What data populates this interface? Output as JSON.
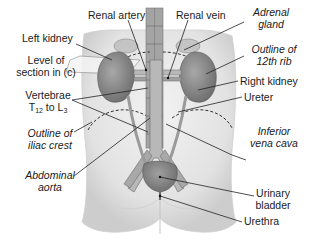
{
  "diagram": {
    "labels": {
      "renal_artery": "Renal artery",
      "renal_vein": "Renal vein",
      "adrenal_gland_1": "Adrenal",
      "adrenal_gland_2": "gland",
      "left_kidney": "Left kidney",
      "level_1": "Level of",
      "level_2": "section in (c)",
      "outline_12th_rib_1": "Outline of",
      "outline_12th_rib_2": "12th rib",
      "right_kidney": "Right kidney",
      "vertebrae_1": "Vertebrae",
      "vertebrae_t": "T",
      "vertebrae_t_sub": "12",
      "vertebrae_to": " to L",
      "vertebrae_l_sub": "3",
      "ureter": "Ureter",
      "outline_iliac_1": "Outline of",
      "outline_iliac_2": "iliac crest",
      "ivc_1": "Inferior",
      "ivc_2": "vena cava",
      "aorta_1": "Abdominal",
      "aorta_2": "aorta",
      "bladder_1": "Urinary",
      "bladder_2": "bladder",
      "urethra": "Urethra"
    },
    "colors": {
      "body": "#e6e6e6",
      "body_shade": "#cfcfcf",
      "kidney": "#8c8c8c",
      "adrenal": "#bdbdbd",
      "spine": "#9a9a9a",
      "vessel": "#b0b0b0",
      "leader": "#222222"
    }
  }
}
